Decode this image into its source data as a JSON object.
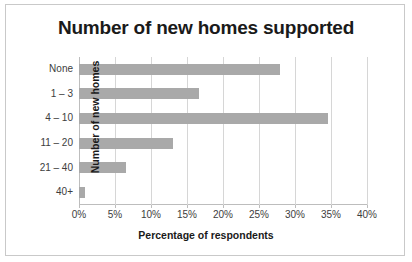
{
  "figure": {
    "border_color": "#c9c9c9",
    "background": "#ffffff"
  },
  "chart_data": {
    "type": "bar",
    "orientation": "horizontal",
    "title": "Number of new homes supported",
    "xlabel": "Percentage of respondents",
    "ylabel": "Number of new homes",
    "categories": [
      "None",
      "1 – 3",
      "4 – 10",
      "11 – 20",
      "21 – 40",
      "40+"
    ],
    "values": [
      27.9,
      16.7,
      34.6,
      13.0,
      6.5,
      0.8
    ],
    "xlim": [
      0,
      40
    ],
    "xtick_values": [
      0,
      5,
      10,
      15,
      20,
      25,
      30,
      35,
      40
    ],
    "xtick_labels": [
      "0%",
      "5%",
      "10%",
      "15%",
      "20%",
      "25%",
      "30%",
      "35%",
      "40%"
    ],
    "grid": "vertical",
    "legend": "none",
    "bar_color": "#a9a9a9",
    "gridline_color": "#d6d6d6",
    "axis_color": "#bdbdbd"
  }
}
